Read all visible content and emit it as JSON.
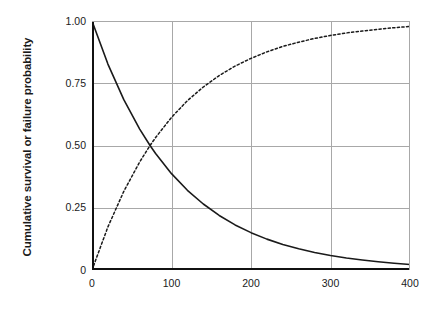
{
  "chart_data": {
    "type": "line",
    "title": "",
    "xlabel": "Time, years",
    "ylabel": "Cumulative survival or failure probability",
    "xlim": [
      0,
      400
    ],
    "ylim": [
      0,
      1.0
    ],
    "xticks": [
      "0",
      "100",
      "200",
      "300",
      "400"
    ],
    "xtick_values": [
      0,
      100,
      200,
      300,
      400
    ],
    "yticks": [
      "0",
      "0.25",
      "0.50",
      "0.75",
      "1.00"
    ],
    "ytick_values": [
      0,
      0.25,
      0.5,
      0.75,
      1.0
    ],
    "grid": true,
    "legend": "none",
    "x": [
      0,
      20,
      40,
      60,
      73,
      80,
      100,
      120,
      140,
      160,
      180,
      200,
      220,
      240,
      260,
      280,
      300,
      320,
      340,
      360,
      380,
      400
    ],
    "series": [
      {
        "name": "Cumulative survival probability",
        "style": "solid",
        "color": "#1a1a1a",
        "values": [
          1.0,
          0.827,
          0.684,
          0.566,
          0.5,
          0.468,
          0.387,
          0.32,
          0.265,
          0.219,
          0.181,
          0.15,
          0.124,
          0.102,
          0.085,
          0.07,
          0.058,
          0.048,
          0.04,
          0.033,
          0.027,
          0.022
        ]
      },
      {
        "name": "Cumulative failure probability",
        "style": "dotted",
        "color": "#1a1a1a",
        "values": [
          0.0,
          0.173,
          0.316,
          0.434,
          0.5,
          0.532,
          0.613,
          0.68,
          0.735,
          0.781,
          0.819,
          0.85,
          0.876,
          0.898,
          0.915,
          0.93,
          0.942,
          0.952,
          0.96,
          0.967,
          0.973,
          0.978
        ]
      }
    ],
    "annotations": {
      "crossing_point": {
        "x": 73,
        "y": 0.5
      }
    }
  },
  "axes": {
    "y_title": "Cumulative survival or failure probability",
    "x_title": "Time, years",
    "y_tick_labels": [
      "1.00",
      "0.75",
      "0.50",
      "0.25",
      "0"
    ],
    "x_tick_labels": [
      "0",
      "100",
      "200",
      "300",
      "400"
    ]
  }
}
